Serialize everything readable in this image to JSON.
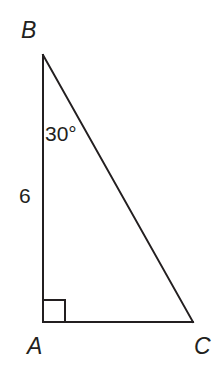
{
  "figure": {
    "kind": "right-triangle-diagram",
    "background_color": "#ffffff",
    "stroke_color": "#231f20",
    "stroke_width": 2,
    "width": 218,
    "height": 380,
    "vertices": {
      "A": {
        "label": "A",
        "x": 43,
        "y": 322
      },
      "B": {
        "label": "B",
        "x": 43,
        "y": 55
      },
      "C": {
        "label": "C",
        "x": 193,
        "y": 322
      }
    },
    "labels": {
      "vertex_b": "B",
      "vertex_a": "A",
      "vertex_c": "C",
      "angle_b": "30°",
      "side_ab": "6"
    },
    "right_angle": {
      "at_vertex": "A",
      "marker": "square",
      "size": 22
    },
    "segments": [
      {
        "name": "AB",
        "from": "B",
        "to": "A",
        "measure": "6"
      },
      {
        "name": "AC",
        "from": "A",
        "to": "C",
        "measure": ""
      },
      {
        "name": "BC",
        "from": "B",
        "to": "C",
        "measure": ""
      }
    ],
    "angles": [
      {
        "at_vertex": "B",
        "measure": "30°"
      },
      {
        "at_vertex": "A",
        "measure": "90°"
      }
    ]
  }
}
